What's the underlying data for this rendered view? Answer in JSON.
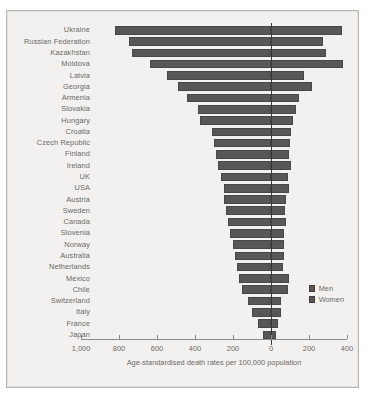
{
  "chart_data": {
    "type": "bar",
    "orientation": "horizontal",
    "subtype": "diverging-population-pyramid",
    "title": "",
    "xlabel": "Age-standardised death rates per 100,000 population",
    "ylabel": "",
    "categories": [
      "Ukraine",
      "Russian Federation",
      "Kazakhstan",
      "Moldova",
      "Latvia",
      "Georgia",
      "Armenia",
      "Slovakia",
      "Hungary",
      "Croatia",
      "Czech Republic",
      "Finland",
      "Ireland",
      "UK",
      "USA",
      "Austria",
      "Sweden",
      "Canada",
      "Slovenia",
      "Norway",
      "Australia",
      "Netherlands",
      "Mexico",
      "Chile",
      "Switzerland",
      "Italy",
      "France",
      "Japan"
    ],
    "series": [
      {
        "name": "Men",
        "direction": "left",
        "values": [
          820,
          750,
          730,
          635,
          545,
          490,
          440,
          385,
          375,
          310,
          300,
          290,
          280,
          265,
          250,
          245,
          235,
          225,
          215,
          200,
          190,
          180,
          170,
          155,
          120,
          100,
          70,
          40
        ]
      },
      {
        "name": "Women",
        "direction": "right",
        "values": [
          375,
          275,
          290,
          380,
          175,
          215,
          145,
          130,
          115,
          105,
          100,
          95,
          105,
          90,
          95,
          80,
          75,
          80,
          70,
          70,
          70,
          65,
          95,
          90,
          55,
          50,
          35,
          25
        ]
      }
    ],
    "axis": {
      "ticks": [
        {
          "label": "1,000",
          "value": -1000
        },
        {
          "label": "800",
          "value": -800
        },
        {
          "label": "600",
          "value": -600
        },
        {
          "label": "400",
          "value": -400
        },
        {
          "label": "200",
          "value": -200
        },
        {
          "label": "0",
          "value": 0
        },
        {
          "label": "200",
          "value": 200
        },
        {
          "label": "400",
          "value": 400
        }
      ],
      "min": -1000,
      "max": 400,
      "grid": false
    },
    "legend": {
      "position": "bottom-right",
      "entries": [
        {
          "label": "Men",
          "color": "#595755"
        },
        {
          "label": "Women",
          "color": "#595755"
        }
      ]
    },
    "colors": {
      "bar": "#595755",
      "background": "#f2f1ef",
      "text": "#6b6966",
      "axis": "#8d8b88",
      "zero_line": "#3a3836"
    }
  }
}
